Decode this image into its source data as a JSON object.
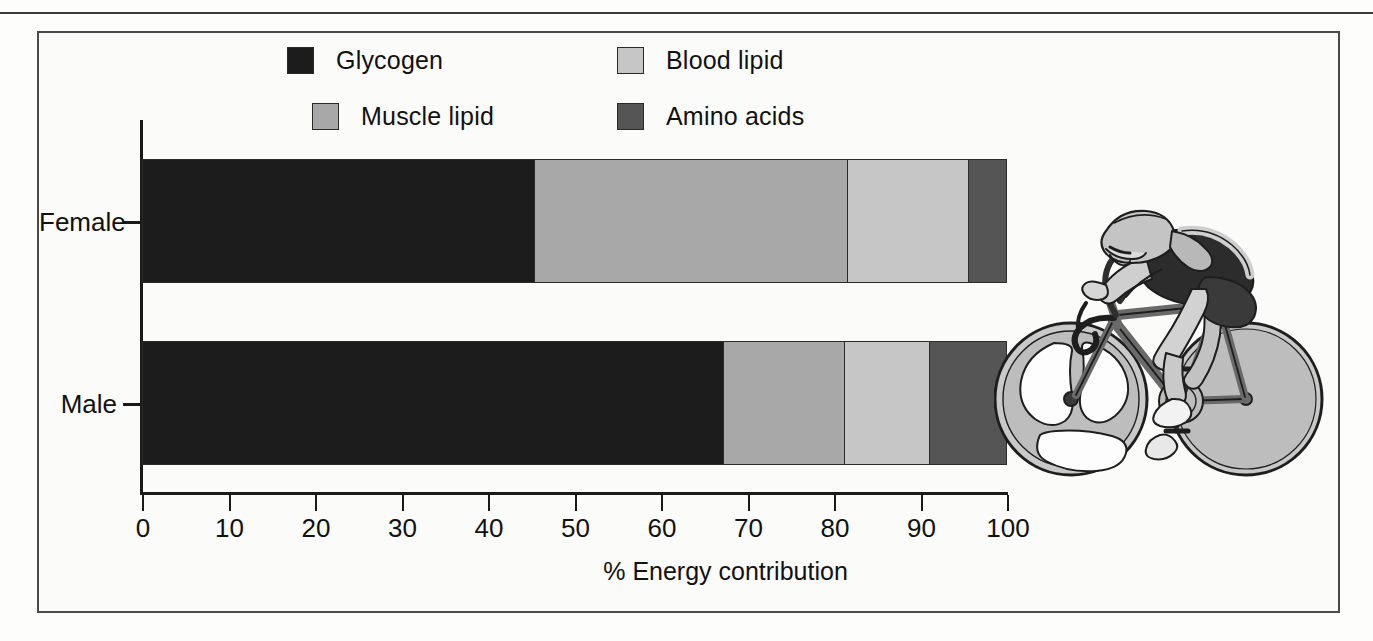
{
  "figure": {
    "frame_color": "#4a4a4a",
    "background": "#fbfbfa"
  },
  "legend": {
    "items": [
      {
        "label": "Glycogen",
        "color": "#1c1c1c"
      },
      {
        "label": "Muscle lipid",
        "color": "#a8a8a8"
      },
      {
        "label": "Blood lipid",
        "color": "#c6c6c6"
      },
      {
        "label": "Amino acids",
        "color": "#555555"
      }
    ]
  },
  "illustration": {
    "name": "time-trial-cyclist",
    "description": "Line-art cyclist in aero tuck on a time-trial bicycle with tri-spoke front wheel and disc rear wheel"
  },
  "chart_data": {
    "type": "bar",
    "orientation": "horizontal",
    "stacked": true,
    "title": "",
    "xlabel": "% Energy contribution",
    "ylabel": "",
    "xlim": [
      0,
      100
    ],
    "ticks": [
      0,
      10,
      20,
      30,
      40,
      50,
      60,
      70,
      80,
      90,
      100
    ],
    "grid": false,
    "legend_position": "top",
    "categories": [
      "Female",
      "Male"
    ],
    "series": [
      {
        "name": "Glycogen",
        "color": "#1c1c1c",
        "values": [
          45.4,
          67.3
        ]
      },
      {
        "name": "Muscle lipid",
        "color": "#a8a8a8",
        "values": [
          36.2,
          14.0
        ]
      },
      {
        "name": "Blood lipid",
        "color": "#c6c6c6",
        "values": [
          14.1,
          9.8
        ]
      },
      {
        "name": "Amino acids",
        "color": "#555555",
        "values": [
          4.3,
          8.9
        ]
      }
    ]
  }
}
